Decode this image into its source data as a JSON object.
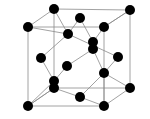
{
  "diagram": {
    "type": "crystal-structure",
    "colors": {
      "atom": "#000000",
      "line": "#8a8a8a",
      "background": "#ffffff"
    },
    "atom_radius": 5,
    "atoms": [
      {
        "id": "a1",
        "x": 54,
        "y": 9
      },
      {
        "id": "a2",
        "x": 130,
        "y": 10
      },
      {
        "id": "a3",
        "x": 28,
        "y": 27
      },
      {
        "id": "a4",
        "x": 80,
        "y": 18
      },
      {
        "id": "a5",
        "x": 104,
        "y": 27
      },
      {
        "id": "a6",
        "x": 68,
        "y": 34
      },
      {
        "id": "a7",
        "x": 93,
        "y": 42
      },
      {
        "id": "a8",
        "x": 93,
        "y": 49
      },
      {
        "id": "a9",
        "x": 41,
        "y": 58
      },
      {
        "id": "a10",
        "x": 118,
        "y": 57
      },
      {
        "id": "a11",
        "x": 67,
        "y": 66
      },
      {
        "id": "a12",
        "x": 104,
        "y": 73
      },
      {
        "id": "a13",
        "x": 54,
        "y": 81
      },
      {
        "id": "a14",
        "x": 54,
        "y": 88
      },
      {
        "id": "a15",
        "x": 130,
        "y": 88
      },
      {
        "id": "a16",
        "x": 80,
        "y": 97
      },
      {
        "id": "a17",
        "x": 28,
        "y": 106
      },
      {
        "id": "a18",
        "x": 104,
        "y": 106
      }
    ],
    "cube_edges": [
      [
        28,
        27,
        104,
        27
      ],
      [
        104,
        27,
        104,
        106
      ],
      [
        104,
        106,
        28,
        106
      ],
      [
        28,
        106,
        28,
        27
      ],
      [
        54,
        9,
        130,
        10
      ],
      [
        130,
        10,
        130,
        88
      ],
      [
        130,
        88,
        54,
        88
      ],
      [
        54,
        88,
        54,
        9
      ],
      [
        28,
        27,
        54,
        9
      ],
      [
        104,
        27,
        130,
        10
      ],
      [
        104,
        106,
        130,
        88
      ],
      [
        28,
        106,
        54,
        88
      ]
    ],
    "bonds": [
      [
        54,
        9,
        68,
        34
      ],
      [
        28,
        27,
        68,
        34
      ],
      [
        80,
        18,
        68,
        34
      ],
      [
        68,
        34,
        41,
        58
      ],
      [
        68,
        34,
        118,
        57
      ],
      [
        80,
        18,
        93,
        42
      ],
      [
        104,
        27,
        93,
        42
      ],
      [
        130,
        10,
        104,
        27
      ],
      [
        93,
        49,
        67,
        66
      ],
      [
        93,
        49,
        104,
        73
      ],
      [
        93,
        42,
        93,
        49
      ],
      [
        118,
        57,
        104,
        73
      ],
      [
        104,
        73,
        130,
        88
      ],
      [
        104,
        73,
        104,
        106
      ],
      [
        104,
        73,
        80,
        97
      ],
      [
        41,
        58,
        54,
        81
      ],
      [
        67,
        66,
        54,
        81
      ],
      [
        54,
        81,
        28,
        106
      ],
      [
        54,
        88,
        28,
        106
      ],
      [
        54,
        88,
        80,
        97
      ],
      [
        80,
        97,
        104,
        106
      ]
    ]
  }
}
